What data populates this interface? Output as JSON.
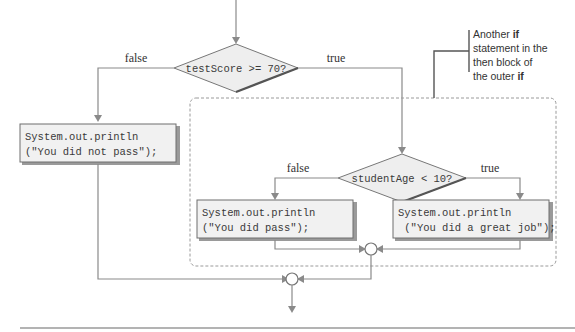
{
  "diagram": {
    "type": "flowchart",
    "outer_condition": {
      "text": "testScore >= 70?",
      "false_label": "false",
      "true_label": "true"
    },
    "inner_condition": {
      "text": "studentAge < 10?",
      "false_label": "false",
      "true_label": "true"
    },
    "statements": {
      "not_pass": {
        "line1": "System.out.println",
        "line2": "(\"You did not pass\");"
      },
      "did_pass": {
        "line1": "System.out.println",
        "line2": "(\"You did pass\");"
      },
      "great_job": {
        "line1": "System.out.println",
        "line2": " (\"You did a great job\");"
      }
    },
    "callout": {
      "line1_prefix": "Another ",
      "line1_bold": "if",
      "line2": "statement in the",
      "line3": "then block of",
      "line4_prefix": "the outer ",
      "line4_bold": "if"
    }
  }
}
